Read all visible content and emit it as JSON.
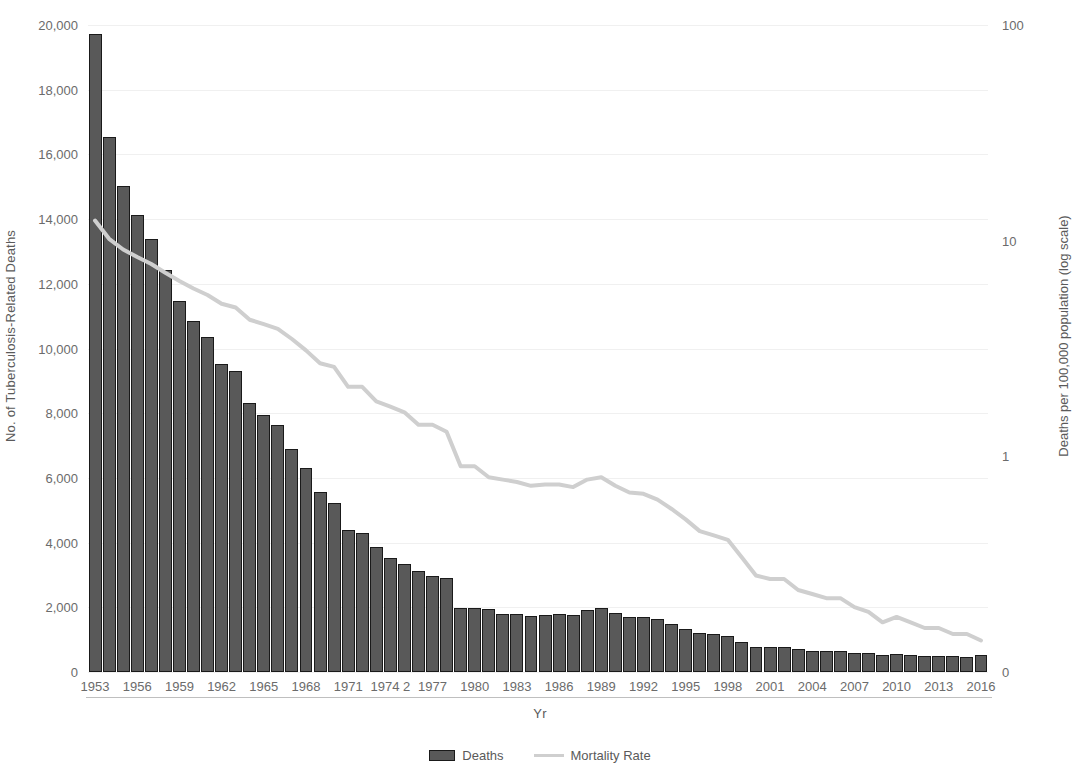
{
  "chart_data": {
    "type": "bar",
    "title": "",
    "xlabel": "Yr",
    "ylabel": "No. of Tuberculosis-Related Deaths",
    "y2label": "Deaths per 100,000 population (log scale)",
    "grid": true,
    "legend_position": "bottom",
    "ylim": [
      0,
      20000
    ],
    "y2lim": [
      0.1,
      100
    ],
    "y2_scale": "log",
    "y_ticks": [
      "0",
      "2,000",
      "4,000",
      "6,000",
      "8,000",
      "10,000",
      "12,000",
      "14,000",
      "16,000",
      "18,000",
      "20,000"
    ],
    "y2_ticks": [
      "0",
      "1",
      "10",
      "100"
    ],
    "x_tick_labels": [
      "1953",
      "1956",
      "1959",
      "1962",
      "1965",
      "1968",
      "1971",
      "1974 2",
      "1977",
      "1980",
      "1983",
      "1986",
      "1989",
      "1992",
      "1995",
      "1998",
      "2001",
      "2004",
      "2007",
      "2010",
      "2013",
      "2016"
    ],
    "categories": [
      "1953",
      "1954",
      "1955",
      "1956",
      "1957",
      "1958",
      "1959",
      "1960",
      "1961",
      "1962",
      "1963",
      "1964",
      "1965",
      "1966",
      "1967",
      "1968",
      "1969",
      "1970",
      "1971",
      "1972",
      "1973",
      "1974",
      "1975",
      "1976",
      "1977",
      "1978",
      "1979",
      "1980",
      "1981",
      "1982",
      "1983",
      "1984",
      "1985",
      "1986",
      "1987",
      "1988",
      "1989",
      "1990",
      "1991",
      "1992",
      "1993",
      "1994",
      "1995",
      "1996",
      "1997",
      "1998",
      "1999",
      "2000",
      "2001",
      "2002",
      "2003",
      "2004",
      "2005",
      "2006",
      "2007",
      "2008",
      "2009",
      "2010",
      "2011",
      "2012",
      "2013",
      "2014",
      "2015",
      "2016"
    ],
    "series": [
      {
        "name": "Deaths",
        "axis": "left",
        "color": "#595959",
        "values": [
          19707,
          16527,
          15016,
          14137,
          13390,
          12417,
          11474,
          10866,
          10350,
          9506,
          9311,
          8303,
          7934,
          7625,
          6901,
          6292,
          5567,
          5217,
          4376,
          4288,
          3875,
          3513,
          3333,
          3130,
          2967,
          2914,
          1978,
          1978,
          1937,
          1807,
          1779,
          1729,
          1752,
          1782,
          1755,
          1921,
          1970,
          1810,
          1713,
          1705,
          1631,
          1478,
          1336,
          1202,
          1166,
          1112,
          930,
          776,
          764,
          784,
          711,
          662,
          648,
          652,
          590,
          590,
          529,
          555,
          536,
          510,
          504,
          493,
          470,
          528
        ]
      },
      {
        "name": "Mortality Rate",
        "axis": "right",
        "color": "#cfcfcf",
        "unit": "deaths per 100,000 population",
        "values": [
          12.4,
          10.2,
          9.1,
          8.4,
          7.8,
          7.1,
          6.5,
          6.0,
          5.6,
          5.1,
          4.9,
          4.3,
          4.1,
          3.9,
          3.5,
          3.1,
          2.7,
          2.6,
          2.1,
          2.1,
          1.8,
          1.7,
          1.6,
          1.4,
          1.4,
          1.3,
          0.9,
          0.9,
          0.8,
          0.78,
          0.76,
          0.73,
          0.74,
          0.74,
          0.72,
          0.78,
          0.8,
          0.73,
          0.68,
          0.67,
          0.63,
          0.57,
          0.51,
          0.45,
          0.43,
          0.41,
          0.34,
          0.28,
          0.27,
          0.27,
          0.24,
          0.23,
          0.22,
          0.22,
          0.2,
          0.19,
          0.17,
          0.18,
          0.17,
          0.16,
          0.16,
          0.15,
          0.15,
          0.14
        ]
      }
    ]
  },
  "legend": {
    "items": [
      {
        "label": "Deaths",
        "marker": "bar-swatch"
      },
      {
        "label": "Mortality Rate",
        "marker": "line-swatch"
      }
    ]
  }
}
